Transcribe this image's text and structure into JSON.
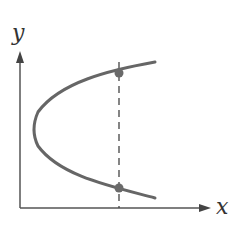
{
  "diagram": {
    "axes": {
      "x_label": "x",
      "y_label": "y"
    },
    "curve": {
      "description": "sideways parabola opening to the right",
      "color": "#666666"
    },
    "vertical_line": {
      "style": "dashed",
      "description": "vertical line intersecting the curve at two points"
    },
    "points": [
      {
        "name": "upper-intersection"
      },
      {
        "name": "lower-intersection"
      }
    ],
    "colors": {
      "axis": "#555555",
      "curve": "#666666",
      "dashed_line": "#444444",
      "point": "#6a6a6a"
    }
  }
}
